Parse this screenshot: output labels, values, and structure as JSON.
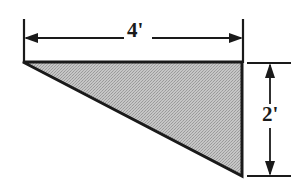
{
  "figure": {
    "shape": {
      "name": "right triangle",
      "fill_color": "#b7b7b7",
      "edge_color": "#1a1a1a",
      "vertices": [
        {
          "name": "top-left",
          "x": 23,
          "y": 62
        },
        {
          "name": "top-right",
          "x": 242,
          "y": 62
        },
        {
          "name": "bottom-right",
          "x": 242,
          "y": 176
        }
      ]
    },
    "background_color": "#ffffff",
    "line_color": "#1a1a1a"
  },
  "dimensions": {
    "width": {
      "label": "4'",
      "value": 4,
      "unit": "feet",
      "unit_symbol": "'",
      "orientation": "horizontal",
      "position": "top"
    },
    "height": {
      "label": "2'",
      "value": 2,
      "unit": "feet",
      "unit_symbol": "'",
      "orientation": "vertical",
      "position": "right"
    }
  }
}
